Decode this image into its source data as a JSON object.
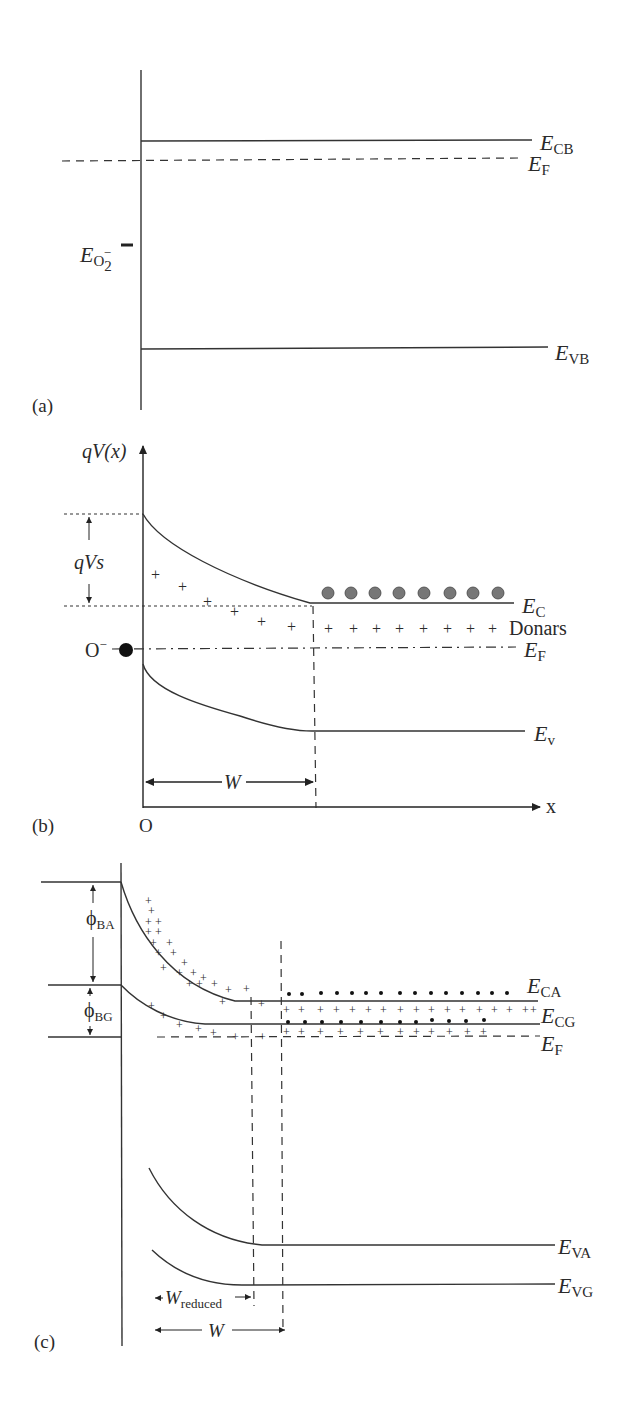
{
  "figure": {
    "panels": [
      {
        "id": "a",
        "label": "(a)",
        "levels": {
          "conduction_band": {
            "main": "E",
            "sub": "CB"
          },
          "fermi_level": {
            "main": "E",
            "sub": "F"
          },
          "valence_band": {
            "main": "E",
            "sub": "VB"
          },
          "oxygen_level": {
            "main": "E",
            "sub": "O",
            "sub2": "2",
            "sup": "−"
          }
        }
      },
      {
        "id": "b",
        "label": "(b)",
        "y_axis_label": "qV(x)",
        "x_axis_label": "x",
        "origin_label": "O",
        "barrier_label": "qVs",
        "donors_label": "Donars",
        "adsorbed_ion": "O",
        "adsorbed_ion_sup": "−",
        "depletion_width": "W",
        "levels": {
          "conduction_band": {
            "main": "E",
            "sub": "C"
          },
          "fermi_level": {
            "main": "E",
            "sub": "F"
          },
          "valence_band": {
            "main": "E",
            "sub": "v"
          }
        },
        "donor_plus": "+",
        "electron_count": 8
      },
      {
        "id": "c",
        "label": "(c)",
        "barrier_air": {
          "main": "ϕ",
          "sub": "BA"
        },
        "barrier_gas": {
          "main": "ϕ",
          "sub": "BG"
        },
        "levels": {
          "conduction_air": {
            "main": "E",
            "sub": "CA"
          },
          "conduction_gas": {
            "main": "E",
            "sub": "CG"
          },
          "fermi_level": {
            "main": "E",
            "sub": "F"
          },
          "valence_air": {
            "main": "E",
            "sub": "VA"
          },
          "valence_gas": {
            "main": "E",
            "sub": "VG"
          }
        },
        "width_reduced": {
          "main": "W",
          "sub": "reduced"
        },
        "width_full": "W"
      }
    ]
  }
}
